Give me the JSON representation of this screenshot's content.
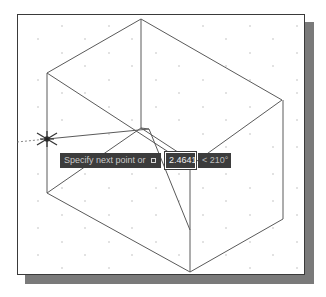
{
  "canvas": {
    "background": "#ffffff",
    "frame_border": "#3a3a3a",
    "shadow_color": "#7a7a7a",
    "line_color": "#555555",
    "grid_dot_color": "#bbbbbb"
  },
  "dynamic_input": {
    "prompt": "Specify next point or",
    "options_icon": "down-arrow-icon",
    "distance_value": "2.4641",
    "angle_value": "< 210°"
  },
  "cursor": {
    "type": "crosshair-icon",
    "position": [
      47,
      139
    ]
  }
}
